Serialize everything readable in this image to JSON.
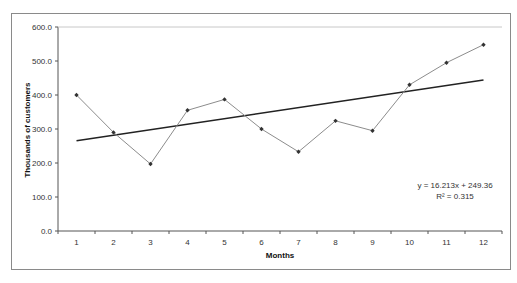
{
  "page": {
    "clipped_title": "Figure: Monthly customers with linear trendline"
  },
  "chart_data": {
    "type": "line",
    "title": "",
    "xlabel": "Months",
    "ylabel": "Thousands of customers",
    "x": [
      1,
      2,
      3,
      4,
      5,
      6,
      7,
      8,
      9,
      10,
      11,
      12
    ],
    "categories": [
      "1",
      "2",
      "3",
      "4",
      "5",
      "6",
      "7",
      "8",
      "9",
      "10",
      "11",
      "12"
    ],
    "series": [
      {
        "name": "Customers",
        "values": [
          400,
          290,
          197,
          355,
          387,
          300,
          233,
          324,
          295,
          430,
          495,
          548
        ],
        "color": "#8c8c8c",
        "marker": "diamond"
      },
      {
        "name": "Linear trendline",
        "values": [
          265.6,
          281.8,
          298.0,
          314.2,
          330.4,
          346.6,
          362.9,
          379.1,
          395.3,
          411.5,
          427.7,
          443.9
        ],
        "color": "#222222",
        "marker": "none"
      }
    ],
    "ylim": [
      0,
      600
    ],
    "yticks": [
      "0.0",
      "100.0",
      "200.0",
      "300.0",
      "400.0",
      "500.0",
      "600.0"
    ],
    "grid": false,
    "legend": "none",
    "annotations": [
      {
        "text": "y = 16.213x + 249.36"
      },
      {
        "text": "R² = 0.315"
      }
    ],
    "trendline": {
      "slope": 16.213,
      "intercept": 249.36,
      "r_squared": 0.315
    }
  },
  "labels": {
    "equation": "y = 16.213x + 249.36",
    "r_squared": "R² = 0.315",
    "xlabel": "Months",
    "ylabel": "Thousands of customers"
  }
}
